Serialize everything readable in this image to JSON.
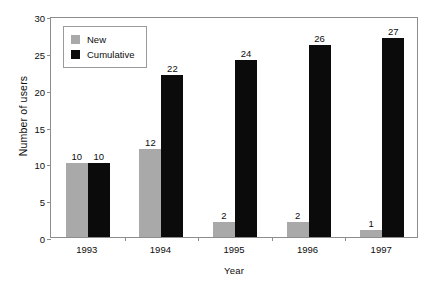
{
  "chart_data": {
    "type": "bar",
    "title": "",
    "xlabel": "Year",
    "ylabel": "Number of users",
    "categories": [
      "1993",
      "1994",
      "1995",
      "1996",
      "1997"
    ],
    "series": [
      {
        "name": "New",
        "color": "#a9a9a9",
        "values": [
          10,
          12,
          2,
          2,
          1
        ]
      },
      {
        "name": "Cumulative",
        "color": "#0b0b0b",
        "values": [
          10,
          22,
          24,
          26,
          27
        ]
      }
    ],
    "ylim": [
      0,
      30
    ],
    "yticks": [
      0,
      5,
      10,
      15,
      20,
      25,
      30
    ],
    "ytick_labels": [
      "0",
      "5",
      "10",
      "15",
      "20",
      "25",
      "30"
    ],
    "grid": false,
    "legend_position": "upper-left-inside",
    "data_labels": true,
    "frame": true
  }
}
